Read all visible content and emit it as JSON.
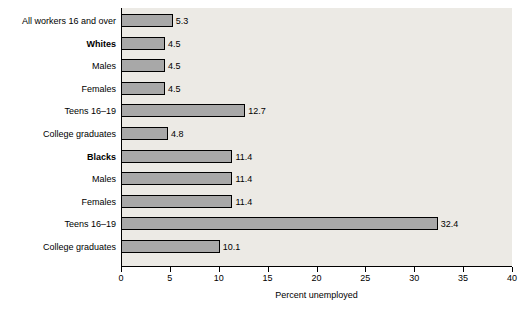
{
  "chart_data": {
    "type": "bar",
    "orientation": "horizontal",
    "title": "",
    "xlabel": "Percent unemployed",
    "ylabel": "",
    "xlim": [
      0,
      40
    ],
    "xticks": [
      0,
      5,
      10,
      15,
      20,
      25,
      30,
      35,
      40
    ],
    "xticklabels": [
      "0",
      "5",
      "10",
      "15",
      "20",
      "25",
      "30",
      "35",
      "40"
    ],
    "grid": false,
    "legend": null,
    "bar_color": "#a8a8a8",
    "bar_edge_color": "#000000",
    "panel_color": "#eceae5",
    "categories": [
      "All workers 16 and over",
      "Whites",
      "Males",
      "Females",
      "Teens 16–19",
      "College graduates",
      "Blacks",
      "Males",
      "Females",
      "Teens 16–19",
      "College graduates"
    ],
    "category_bold": [
      false,
      true,
      false,
      false,
      false,
      false,
      true,
      false,
      false,
      false,
      false
    ],
    "values": [
      5.3,
      4.5,
      4.5,
      4.5,
      12.7,
      4.8,
      11.4,
      11.4,
      11.4,
      32.4,
      10.1
    ],
    "value_labels": [
      "5.3",
      "4.5",
      "4.5",
      "4.5",
      "12.7",
      "4.8",
      "11.4",
      "11.4",
      "11.4",
      "32.4",
      "10.1"
    ]
  }
}
